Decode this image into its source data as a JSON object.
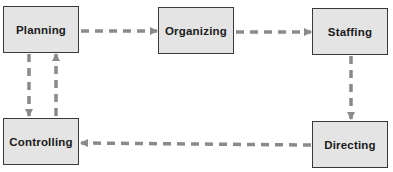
{
  "diagram": {
    "type": "management-functions-cycle",
    "nodes": [
      {
        "id": "planning",
        "label": "Planning"
      },
      {
        "id": "organizing",
        "label": "Organizing"
      },
      {
        "id": "staffing",
        "label": "Staffing"
      },
      {
        "id": "directing",
        "label": "Directing"
      },
      {
        "id": "controlling",
        "label": "Controlling"
      }
    ],
    "edges": [
      {
        "from": "planning",
        "to": "organizing",
        "style": "dashed"
      },
      {
        "from": "organizing",
        "to": "staffing",
        "style": "dashed"
      },
      {
        "from": "staffing",
        "to": "directing",
        "style": "dashed"
      },
      {
        "from": "directing",
        "to": "controlling",
        "style": "dashed"
      },
      {
        "from": "planning",
        "to": "controlling",
        "style": "dashed"
      },
      {
        "from": "controlling",
        "to": "planning",
        "style": "dashed"
      }
    ],
    "colors": {
      "box_fill": "#e4e4e4",
      "box_border": "#3a3a3a",
      "arrow": "#8a8a8a",
      "text": "#1a1a1a"
    }
  }
}
